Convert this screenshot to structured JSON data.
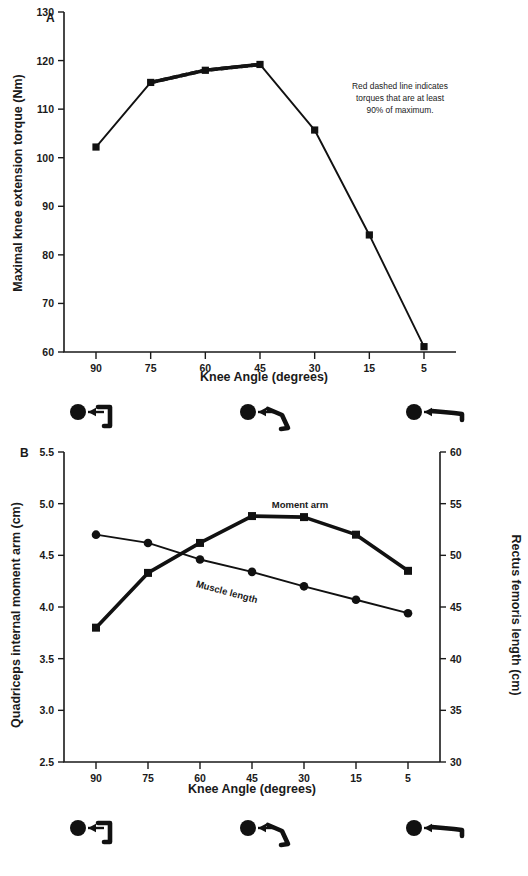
{
  "figure": {
    "panelA_letter": "A",
    "panelB_letter": "B",
    "annotation": "Red dashed line indicates torques that are at least 90% of maximum.",
    "annotation_line1": "Red dashed line indicates",
    "annotation_line2": "torques that are at least",
    "annotation_line3": "90% of maximum.",
    "xaxis_title": "Knee Angle (degrees)",
    "panelA_yaxis_title": "Maximal knee extension torque (Nm)",
    "panelB_yaxis_left_title": "Quadriceps internal moment arm (cm)",
    "panelB_yaxis_right_title": "Rectus femoris length (cm)",
    "series_label_moment_arm": "Moment arm",
    "series_label_muscle_length": "Muscle length",
    "leg_icon_names": [
      "leg-flexed-90-icon",
      "leg-flexed-45-icon",
      "leg-extended-5-icon"
    ]
  },
  "chart_data": [
    {
      "type": "line",
      "panel": "A",
      "title": "",
      "xlabel": "Knee Angle (degrees)",
      "ylabel": "Maximal knee extension torque (Nm)",
      "categories": [
        "90",
        "75",
        "60",
        "45",
        "30",
        "15",
        "5"
      ],
      "ylim": [
        60,
        130
      ],
      "yticks": [
        60,
        70,
        80,
        90,
        100,
        110,
        120,
        130
      ],
      "grid": false,
      "legend": "none",
      "series": [
        {
          "name": "Maximal knee extension torque",
          "marker": "square",
          "values": [
            102.2,
            115.5,
            118.0,
            119.2,
            105.7,
            84.1,
            61.1
          ]
        }
      ],
      "highlight_segments": [
        {
          "name": "at-least-90-percent-of-maximum",
          "style": "dashed",
          "color": "#cc1122",
          "from_category": "75",
          "to_category": "45"
        }
      ],
      "annotations": [
        "Red dashed line indicates",
        "torques that are at least",
        "90% of maximum."
      ]
    },
    {
      "type": "line",
      "panel": "B",
      "title": "",
      "xlabel": "Knee Angle (degrees)",
      "ylabel": "Quadriceps internal moment arm (cm)",
      "ylabel_right": "Rectus femoris length (cm)",
      "categories": [
        "90",
        "75",
        "60",
        "45",
        "30",
        "15",
        "5"
      ],
      "ylim": [
        2.5,
        5.5
      ],
      "yticks": [
        2.5,
        3.0,
        3.5,
        4.0,
        4.5,
        5.0,
        5.5
      ],
      "ylim_right": [
        30,
        60
      ],
      "yticks_right": [
        30,
        35,
        40,
        45,
        50,
        55,
        60
      ],
      "grid": false,
      "legend": "inline-labels",
      "series": [
        {
          "name": "Moment arm",
          "axis": "left",
          "marker": "square",
          "values": [
            3.8,
            4.33,
            4.62,
            4.88,
            4.87,
            4.7,
            4.35
          ]
        },
        {
          "name": "Muscle length",
          "axis": "right",
          "marker": "circle",
          "values": [
            52.0,
            51.2,
            49.6,
            48.4,
            47.0,
            45.7,
            44.4
          ]
        }
      ]
    }
  ]
}
